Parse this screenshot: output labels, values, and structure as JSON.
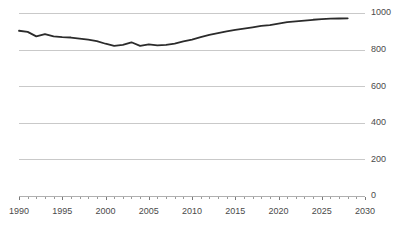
{
  "chart_data": {
    "type": "line",
    "title": "",
    "subtitle": "",
    "xlabel": "",
    "ylabel": "",
    "xlim": [
      1990,
      2030
    ],
    "ylim": [
      0,
      1000
    ],
    "grid": true,
    "legend": false,
    "legend_position": "none",
    "line_color": "#2b2b2b",
    "grid_color": "#c9c9c9",
    "axis_color": "#b0b0b0",
    "tick_label_color": "#4a4a4a",
    "background_color": "#ffffff",
    "y_ticks": [
      0,
      200,
      400,
      600,
      800,
      1000
    ],
    "y_tick_labels": [
      "0",
      "200",
      "400",
      "600",
      "800",
      "1000"
    ],
    "x_ticks": [
      1990,
      1995,
      2000,
      2005,
      2010,
      2015,
      2020,
      2025,
      2030
    ],
    "x_tick_labels": [
      "1990",
      "1995",
      "2000",
      "2005",
      "2010",
      "2015",
      "2020",
      "2025",
      "2030"
    ],
    "x_minor_tick_step": 1,
    "series": [
      {
        "name": "series-1",
        "color": "#2b2b2b",
        "x": [
          1990,
          1991,
          1992,
          1993,
          1994,
          1995,
          1996,
          1997,
          1998,
          1999,
          2000,
          2001,
          2002,
          2003,
          2004,
          2005,
          2006,
          2007,
          2008,
          2009,
          2010,
          2011,
          2012,
          2013,
          2014,
          2015,
          2016,
          2017,
          2018,
          2019,
          2020,
          2021,
          2022,
          2023,
          2024,
          2025,
          2026,
          2027,
          2028
        ],
        "values": [
          903,
          897,
          872,
          885,
          872,
          868,
          866,
          860,
          854,
          846,
          832,
          820,
          826,
          840,
          820,
          829,
          823,
          826,
          833,
          845,
          855,
          868,
          880,
          890,
          900,
          908,
          915,
          922,
          930,
          934,
          942,
          950,
          954,
          958,
          963,
          966,
          969,
          970,
          971
        ]
      }
    ]
  }
}
